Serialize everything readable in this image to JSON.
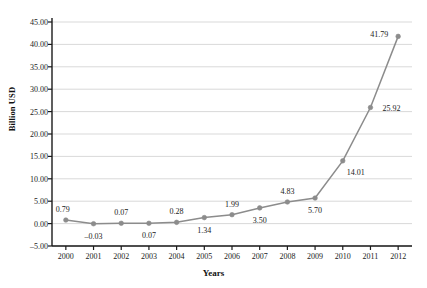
{
  "chart_data": {
    "type": "line",
    "title": "",
    "xlabel": "Years",
    "ylabel": "Billion USD",
    "categories": [
      "2000",
      "2001",
      "2002",
      "2003",
      "2004",
      "2005",
      "2006",
      "2007",
      "2008",
      "2009",
      "2010",
      "2011",
      "2012"
    ],
    "values": [
      0.79,
      -0.03,
      0.07,
      0.07,
      0.28,
      1.34,
      1.99,
      3.5,
      4.83,
      5.7,
      14.01,
      25.92,
      41.79
    ],
    "point_labels": [
      "0.79",
      "-0.03",
      "0.07",
      "0.07",
      "0.28",
      "1.34",
      "1.99",
      "3.50",
      "4.83",
      "5.70",
      "14.01",
      "25.92",
      "41.79"
    ],
    "label_positions": [
      "above-left",
      "below",
      "above",
      "below",
      "above",
      "below",
      "above",
      "below",
      "above",
      "below",
      "below-right",
      "right",
      "left"
    ],
    "ylim": [
      -5.0,
      45.0
    ],
    "ytick_values": [
      -5.0,
      0.0,
      5.0,
      10.0,
      15.0,
      20.0,
      25.0,
      30.0,
      35.0,
      40.0,
      45.0
    ],
    "ytick_labels": [
      "-5.00",
      "0.00",
      "5.00",
      "10.00",
      "15.00",
      "20.00",
      "25.00",
      "30.00",
      "35.00",
      "40.00",
      "45.00"
    ],
    "grid": true,
    "grid_axis": "y",
    "legend": false,
    "series_color": "#8c8c8c",
    "marker": "circle",
    "marker_color": "#8c8c8c",
    "axis_color": "#1a1a1a",
    "grid_color": "#c8c8c8",
    "background": "#ffffff"
  }
}
